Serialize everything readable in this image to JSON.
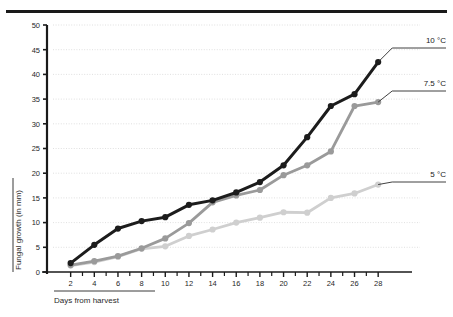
{
  "figure": {
    "top_rule": "horizontal-rule",
    "caption_underline": "caption-rule"
  },
  "chart_data": {
    "type": "line",
    "title": "",
    "xlabel": "Days from harvest",
    "ylabel": "Fungal growth (in mm)",
    "x": [
      2,
      4,
      6,
      8,
      10,
      12,
      14,
      16,
      18,
      20,
      22,
      24,
      26,
      28
    ],
    "xlim": [
      0,
      29
    ],
    "ylim": [
      0,
      50
    ],
    "xticks": [
      2,
      4,
      6,
      8,
      10,
      12,
      14,
      16,
      18,
      20,
      22,
      24,
      26,
      28
    ],
    "yticks": [
      0,
      5,
      10,
      15,
      20,
      25,
      30,
      35,
      40,
      45,
      50
    ],
    "xtick_labels": [
      "2",
      "4",
      "6",
      "8",
      "10",
      "12",
      "14",
      "16",
      "18",
      "20",
      "22",
      "24",
      "26",
      "28"
    ],
    "ytick_labels": [
      "0",
      "5",
      "10",
      "15",
      "20",
      "25",
      "30",
      "35",
      "40",
      "45",
      "50"
    ],
    "grid": true,
    "grid_style": "dotted-horizontal",
    "legend_position": "right-inline-labels",
    "markers": "filled-circle",
    "series": [
      {
        "name": "10 °C",
        "color": "#1c1c1c",
        "values": [
          1.8,
          5.5,
          8.8,
          10.3,
          11.1,
          13.6,
          14.5,
          16.1,
          18.2,
          21.6,
          27.3,
          33.6,
          36.0,
          42.5
        ]
      },
      {
        "name": "7.5 °C",
        "color": "#9a9a9a",
        "values": [
          1.4,
          2.2,
          3.2,
          4.8,
          6.8,
          9.9,
          14.1,
          15.5,
          16.6,
          19.6,
          21.6,
          24.4,
          33.6,
          34.4
        ]
      },
      {
        "name": "5 °C",
        "color": "#cfcfcf",
        "values": [
          1.3,
          2.0,
          3.1,
          4.7,
          5.2,
          7.3,
          8.6,
          10.0,
          11.0,
          12.1,
          12.0,
          15.0,
          15.9,
          17.7
        ]
      }
    ]
  }
}
